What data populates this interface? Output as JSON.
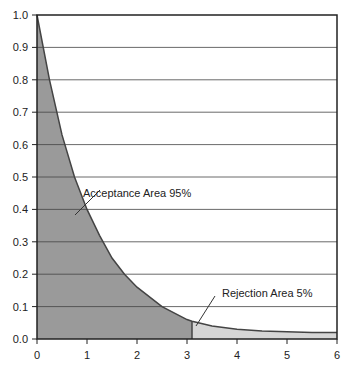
{
  "chart_data": {
    "type": "area",
    "title": "",
    "xlabel": "",
    "ylabel": "",
    "xlim": [
      0,
      6
    ],
    "ylim": [
      0,
      1.0
    ],
    "grid": "horizontal",
    "x_ticks": [
      "0",
      "1",
      "2",
      "3",
      "4",
      "5",
      "6"
    ],
    "y_ticks": [
      "0.0",
      "0.1",
      "0.2",
      "0.3",
      "0.4",
      "0.5",
      "0.6",
      "0.7",
      "0.8",
      "0.9",
      "1.0"
    ],
    "curve": {
      "x": [
        0,
        0.25,
        0.5,
        0.75,
        1.0,
        1.25,
        1.5,
        1.75,
        2.0,
        2.5,
        3.0,
        3.1,
        3.5,
        4.0,
        4.5,
        5.0,
        5.5,
        6.0
      ],
      "y": [
        1.0,
        0.8,
        0.63,
        0.5,
        0.4,
        0.32,
        0.25,
        0.2,
        0.16,
        0.1,
        0.06,
        0.055,
        0.04,
        0.03,
        0.025,
        0.022,
        0.02,
        0.02
      ]
    },
    "critical_value": 3.1,
    "regions": [
      {
        "name": "Acceptance Area",
        "percent": "95%",
        "from": 0,
        "to": 3.1,
        "color": "#9a9a9a"
      },
      {
        "name": "Rejection Area",
        "percent": "5%",
        "from": 3.1,
        "to": 6,
        "color": "#d6d6d6"
      }
    ],
    "annotations": [
      {
        "text": "Acceptance Area  95%"
      },
      {
        "text": "Rejection Area  5%"
      }
    ]
  }
}
